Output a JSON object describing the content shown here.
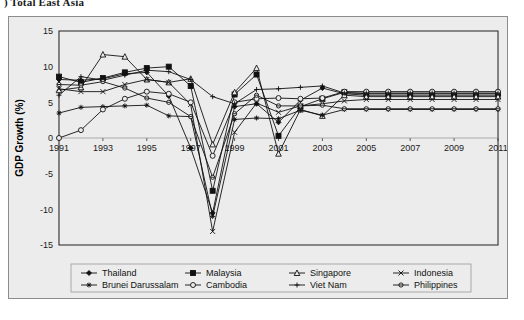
{
  "caption": ") Total East Asia",
  "figure": {
    "background_color": "#ececec",
    "frame_color": "#8c8c8c",
    "line_color": "#111111"
  },
  "chart_data": {
    "type": "line",
    "title": "",
    "xlabel": "",
    "ylabel": "GDP Growth (%)",
    "ylim": [
      -15,
      15
    ],
    "ytick_labels": [
      "15",
      "10",
      "5",
      "0",
      "-5",
      "-10",
      "-15"
    ],
    "yticks": [
      15,
      10,
      5,
      0,
      -5,
      -10,
      -15
    ],
    "xlim": [
      1991,
      2011
    ],
    "xtick_labels": [
      "1991",
      "1993",
      "1995",
      "1997",
      "1999",
      "2001",
      "2003",
      "2005",
      "2007",
      "2009",
      "2011"
    ],
    "xticks": [
      1991,
      1993,
      1995,
      1997,
      1999,
      2001,
      2003,
      2005,
      2007,
      2009,
      2011
    ],
    "x": [
      1991,
      1992,
      1993,
      1994,
      1995,
      1996,
      1997,
      1998,
      1999,
      2000,
      2001,
      2002,
      2003,
      2004,
      2005,
      2006,
      2007,
      2008,
      2009,
      2010,
      2011
    ],
    "grid": true,
    "legend_position": "bottom",
    "series": [
      {
        "name": "Thailand",
        "marker": "diamond-filled",
        "values": [
          8.2,
          8.1,
          8.3,
          9.0,
          9.2,
          5.9,
          -1.4,
          -10.5,
          4.4,
          4.8,
          2.2,
          5.3,
          7.0,
          6.2,
          6.0,
          6.0,
          6.0,
          6.0,
          6.0,
          6.0,
          6.0
        ]
      },
      {
        "name": "Malaysia",
        "marker": "square-filled",
        "values": [
          8.6,
          7.8,
          8.4,
          9.2,
          9.8,
          10.0,
          7.3,
          -7.4,
          6.1,
          8.9,
          0.3,
          4.4,
          5.5,
          6.4,
          6.2,
          6.2,
          6.2,
          6.2,
          6.2,
          6.2,
          6.2
        ]
      },
      {
        "name": "Singapore",
        "marker": "triangle-open",
        "values": [
          6.7,
          7.1,
          11.7,
          11.4,
          8.2,
          7.8,
          8.3,
          -0.9,
          6.4,
          9.8,
          -2.2,
          4.0,
          3.1,
          6.0,
          5.8,
          5.8,
          5.8,
          5.8,
          5.8,
          5.8,
          5.8
        ]
      },
      {
        "name": "Indonesia",
        "marker": "x",
        "values": [
          6.9,
          6.5,
          6.5,
          7.5,
          8.2,
          7.8,
          4.7,
          -13.1,
          0.8,
          4.9,
          3.6,
          4.5,
          4.8,
          5.2,
          5.4,
          5.4,
          5.4,
          5.4,
          5.4,
          5.4,
          5.4
        ]
      },
      {
        "name": "Brunei Darussalam",
        "marker": "star",
        "values": [
          3.5,
          4.3,
          4.4,
          4.5,
          4.6,
          3.1,
          3.0,
          -11.0,
          2.6,
          2.8,
          2.7,
          3.9,
          3.2,
          4.0,
          4.0,
          4.0,
          4.0,
          4.0,
          4.0,
          4.0,
          4.0
        ]
      },
      {
        "name": "Cambodia",
        "marker": "circle-open",
        "values": [
          0.0,
          1.1,
          4.0,
          5.5,
          6.5,
          6.2,
          5.0,
          -2.5,
          5.0,
          5.5,
          5.6,
          5.5,
          5.6,
          6.5,
          6.5,
          6.5,
          6.5,
          6.5,
          6.5,
          6.5,
          6.5
        ]
      },
      {
        "name": "Viet Nam",
        "marker": "plus",
        "values": [
          6.0,
          8.6,
          8.1,
          8.8,
          9.5,
          9.3,
          8.2,
          5.8,
          4.8,
          6.8,
          6.9,
          7.1,
          7.3,
          6.3,
          6.3,
          6.3,
          6.3,
          6.3,
          6.3,
          6.3,
          6.3
        ]
      },
      {
        "name": "Philippines",
        "marker": "circle-dash",
        "values": [
          7.5,
          7.4,
          7.9,
          7.0,
          5.6,
          5.0,
          3.0,
          -5.5,
          3.4,
          6.0,
          4.5,
          4.5,
          4.6,
          4.1,
          4.1,
          4.1,
          4.1,
          4.1,
          4.1,
          4.1,
          4.1
        ]
      }
    ]
  },
  "legend": {
    "row1": [
      "Thailand",
      "Malaysia",
      "Singapore",
      "Indonesia"
    ],
    "row2": [
      "Brunei Darussalam",
      "Cambodia",
      "Viet Nam",
      "Philippines"
    ]
  }
}
